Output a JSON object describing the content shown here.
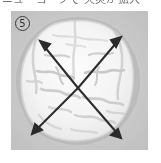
{
  "page": {
    "width": 161,
    "height": 163,
    "background": "#ffffff"
  },
  "caption": {
    "text": "ニューヨークで 火災が拡大",
    "note": "partially cropped text row at top edge"
  },
  "panel": {
    "index_label": "5",
    "index_style": "circled-number",
    "background_color": "#c9c9c9",
    "modality": "axial-head-ct",
    "border_color": "#bdbdbd"
  },
  "scan": {
    "tissue_fill": "#f2f2f2",
    "tissue_highlight": "#fbfbfb",
    "skull_rim": "#b3b3b3",
    "outer_halo": "#bfbfbf",
    "sulci_color": "#cfcfcf",
    "midline_color": "#d4d4d4"
  },
  "annotations": {
    "arrow_color": "#2b2b2b",
    "arrow_stroke_width": 2.0,
    "arrow_head_length": 9,
    "center_point": {
      "x": 67,
      "y": 77
    },
    "arrows": [
      {
        "name": "arrow-upper-left",
        "direction": "upper-left",
        "from": {
          "x": 67,
          "y": 77
        },
        "to": {
          "x": 29,
          "y": 30
        }
      },
      {
        "name": "arrow-upper-right",
        "direction": "upper-right",
        "from": {
          "x": 67,
          "y": 77
        },
        "to": {
          "x": 110,
          "y": 26
        }
      },
      {
        "name": "arrow-lower-left",
        "direction": "lower-left",
        "from": {
          "x": 67,
          "y": 77
        },
        "to": {
          "x": 21,
          "y": 123
        }
      },
      {
        "name": "arrow-lower-right",
        "direction": "lower-right",
        "from": {
          "x": 67,
          "y": 77
        },
        "to": {
          "x": 110,
          "y": 127
        }
      }
    ]
  }
}
